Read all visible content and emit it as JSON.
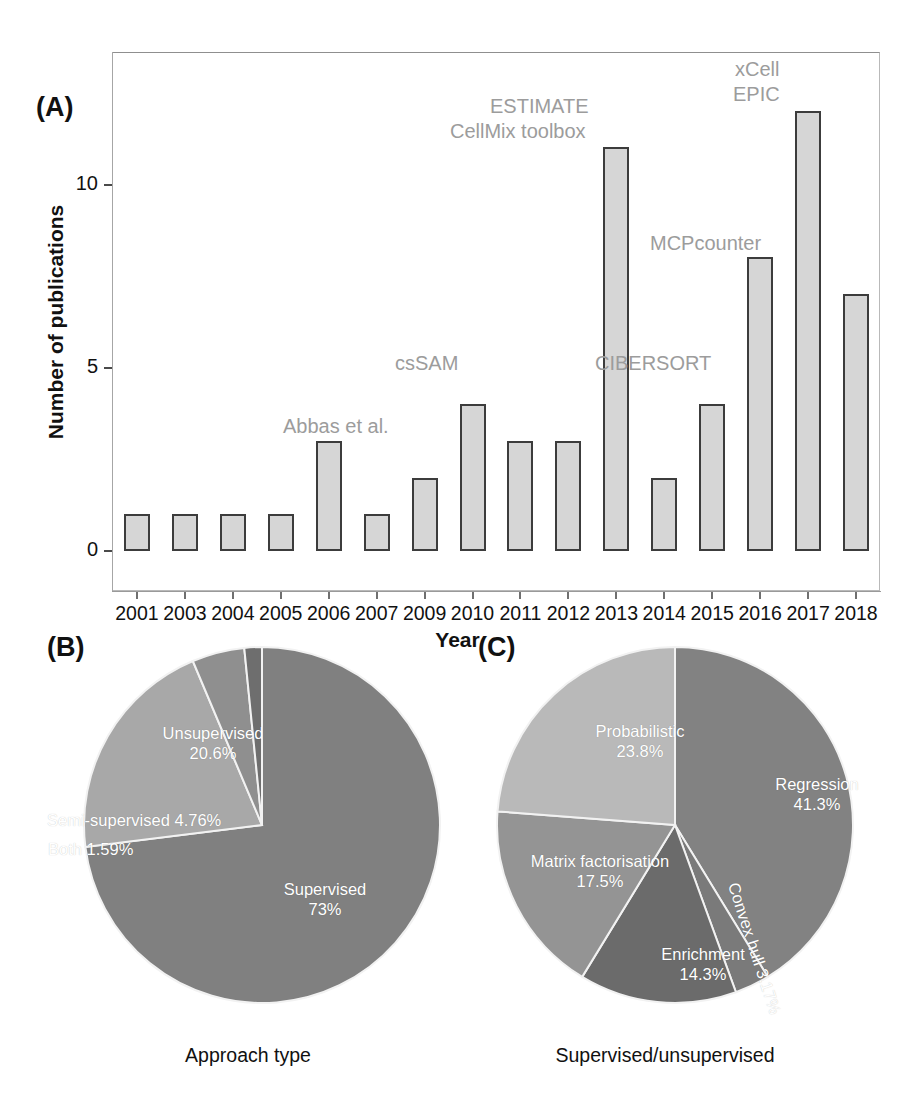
{
  "figure": {
    "panels": [
      {
        "id": "A",
        "label": "(A)"
      },
      {
        "id": "B",
        "label": "(B)"
      },
      {
        "id": "C",
        "label": "(C)"
      }
    ]
  },
  "panelA": {
    "label": "(A)",
    "xlabel": "Year",
    "ylabel": "Number of publications",
    "ytick_labels": [
      "0",
      "5",
      "10"
    ],
    "annotations": [
      {
        "text": "Abbas et al.",
        "year": "2009"
      },
      {
        "text": "csSAM",
        "year": "2010"
      },
      {
        "text": "ESTIMATE",
        "year": "2013"
      },
      {
        "text": "CellMix toolbox",
        "year": "2013"
      },
      {
        "text": "CIBERSORT",
        "year": "2015"
      },
      {
        "text": "MCPcounter",
        "year": "2016"
      },
      {
        "text": "xCell",
        "year": "2017"
      },
      {
        "text": "EPIC",
        "year": "2017"
      }
    ]
  },
  "panelB": {
    "label": "(B)",
    "caption": "Approach type",
    "labels": [
      "Supervised",
      "Unsupervised",
      "Semi-supervised",
      "Both"
    ],
    "values_text": [
      "73%",
      "20.6%",
      "4.76%",
      "1.59%"
    ]
  },
  "panelC": {
    "label": "(C)",
    "caption": "Supervised/unsupervised",
    "labels": [
      "Regression",
      "Probabilistic",
      "Matrix factorisation",
      "Enrichment",
      "Convex hull"
    ],
    "values_text": [
      "41.3%",
      "23.8%",
      "17.5%",
      "14.3%",
      "3.17%"
    ]
  },
  "colors": {
    "bar_fill": "#d6d6d6",
    "bar_stroke": "#3c3c3c",
    "annotation_text": "#9c9c9c",
    "supervised": "#808080",
    "unsupervised": "#a8a8a8",
    "semi_supervised": "#8f8f8f",
    "both": "#6e6e6e",
    "regression": "#828282",
    "probabilistic": "#b9b9b9",
    "matrix_factorisation": "#949494",
    "enrichment": "#6b6b6b",
    "convex_hull": "#7a7a7a"
  },
  "chart_data": [
    {
      "type": "bar",
      "panel": "A",
      "title": "",
      "xlabel": "Year",
      "ylabel": "Number of publications",
      "categories": [
        "2001",
        "2003",
        "2004",
        "2005",
        "2006",
        "2007",
        "2009",
        "2010",
        "2011",
        "2012",
        "2013",
        "2014",
        "2015",
        "2016",
        "2017",
        "2018"
      ],
      "values": [
        1,
        1,
        1,
        1,
        3,
        1,
        2,
        4,
        3,
        3,
        11,
        2,
        4,
        8,
        12,
        7
      ],
      "ylim": [
        0,
        13
      ],
      "yticks": [
        0,
        5,
        10
      ],
      "grid": false,
      "legend": "none",
      "annotations": [
        {
          "year": "2009",
          "text": "Abbas et al."
        },
        {
          "year": "2010",
          "text": "csSAM"
        },
        {
          "year": "2013",
          "text": "ESTIMATE\nCellMix toolbox"
        },
        {
          "year": "2015",
          "text": "CIBERSORT"
        },
        {
          "year": "2016",
          "text": "MCPcounter"
        },
        {
          "year": "2017",
          "text": "xCell\nEPIC"
        }
      ]
    },
    {
      "type": "pie",
      "panel": "B",
      "title": "Approach type",
      "labels": [
        "Supervised",
        "Unsupervised",
        "Semi-supervised",
        "Both"
      ],
      "values": [
        73,
        20.6,
        4.76,
        1.59
      ],
      "value_labels": [
        "73%",
        "20.6%",
        "4.76%",
        "1.59%"
      ],
      "colors": [
        "#808080",
        "#a8a8a8",
        "#8f8f8f",
        "#6e6e6e"
      ],
      "start_angle_deg": 0,
      "direction": "clockwise",
      "legend": "none"
    },
    {
      "type": "pie",
      "panel": "C",
      "title": "Supervised/unsupervised",
      "labels": [
        "Regression",
        "Convex hull",
        "Enrichment",
        "Matrix factorisation",
        "Probabilistic"
      ],
      "values": [
        41.3,
        3.17,
        14.3,
        17.5,
        23.8
      ],
      "value_labels": [
        "41.3%",
        "3.17%",
        "14.3%",
        "17.5%",
        "23.8%"
      ],
      "colors": [
        "#828282",
        "#7a7a7a",
        "#6b6b6b",
        "#949494",
        "#b9b9b9"
      ],
      "start_angle_deg": 0,
      "direction": "clockwise",
      "legend": "none"
    }
  ]
}
